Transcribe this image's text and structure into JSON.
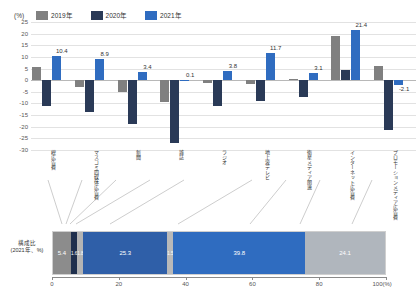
{
  "legend": {
    "unit": "(%)",
    "items": [
      {
        "label": "2019年",
        "color": "#808080"
      },
      {
        "label": "2020年",
        "color": "#2a3a57"
      },
      {
        "label": "2021年",
        "color": "#2f6cc0"
      }
    ]
  },
  "chart_data": [
    {
      "type": "bar",
      "title": "",
      "xlabel": "",
      "ylabel": "(%)",
      "ylim": [
        -30,
        25
      ],
      "yticks": [
        25,
        20,
        15,
        10,
        5,
        0,
        -5,
        -10,
        -15,
        -20,
        -25,
        -30
      ],
      "grid": true,
      "legend_position": "top",
      "categories": [
        "総広告費",
        "マスコミ四媒体広告費",
        "新聞",
        "雑誌",
        "ラジオ",
        "地上波テレビ",
        "衛星メディア関連",
        "インターネット広告費",
        "プロモーションメディア広告費"
      ],
      "series": [
        {
          "name": "2019年",
          "values": [
            5.8,
            -2.8,
            -5.0,
            -9.2,
            -1.3,
            -1.5,
            0.4,
            18.8,
            6.2
          ]
        },
        {
          "name": "2020年",
          "values": [
            -11.2,
            -13.6,
            -18.9,
            -27.1,
            -11.0,
            -8.9,
            -7.1,
            4.4,
            -21.2
          ]
        },
        {
          "name": "2021年",
          "values": [
            10.4,
            8.9,
            3.4,
            0.1,
            3.8,
            11.7,
            3.1,
            21.4,
            -2.1
          ]
        }
      ],
      "data_labels_2021": [
        "10.4",
        "8.9",
        "3.4",
        "0.1",
        "3.8",
        "11.7",
        "3.1",
        "21.4",
        "-2.1"
      ]
    },
    {
      "type": "bar",
      "orientation": "horizontal-stacked",
      "row_label_line1": "構成比",
      "row_label_line2": "(2021年、%)",
      "xlim": [
        0,
        100
      ],
      "xticks": [
        0,
        20,
        40,
        60,
        80,
        100
      ],
      "xtick_labels": [
        "0",
        "20",
        "40",
        "60",
        "80",
        "100(%)"
      ],
      "segments": [
        {
          "name": "新聞",
          "value": 5.4,
          "label": "5.4",
          "color": "#8c8c8c"
        },
        {
          "name": "雑誌",
          "value": 1.6,
          "label": "1.6",
          "color": "#1f2f4d"
        },
        {
          "name": "ラジオ",
          "value": 1.8,
          "label": "1.8",
          "color": "#b4b4b4"
        },
        {
          "name": "地上波テレビ",
          "value": 25.3,
          "label": "25.3",
          "color": "#2f5fa8"
        },
        {
          "name": "衛星メディア関連",
          "value": 1.5,
          "label": "1.5",
          "color": "#b9b9b9"
        },
        {
          "name": "インターネット広告費",
          "value": 39.8,
          "label": "39.8",
          "color": "#2f6cc0"
        },
        {
          "name": "プロモーションメディア広告費",
          "value": 24.1,
          "label": "24.1",
          "color": "#b0b6bd"
        }
      ]
    }
  ]
}
